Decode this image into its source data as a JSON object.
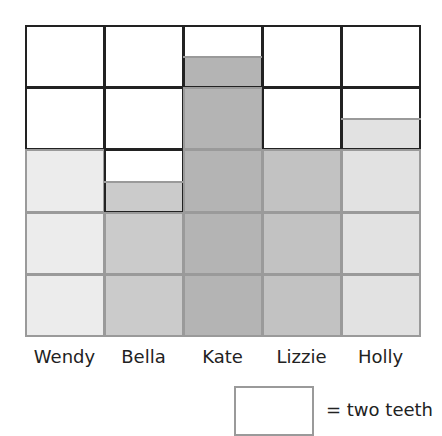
{
  "chart_data": {
    "type": "bar",
    "title": "",
    "xlabel": "",
    "ylabel": "",
    "categories": [
      "Wendy",
      "Bella",
      "Kate",
      "Lizzie",
      "Holly"
    ],
    "values": [
      6,
      5,
      9,
      6,
      7
    ],
    "units_per_square": 2,
    "ylim": [
      0,
      10
    ],
    "grid": true,
    "colors": [
      "#ececec",
      "#cbcbcb",
      "#b4b4b4",
      "#c2c2c2",
      "#e2e2e2"
    ],
    "legend": {
      "symbol": "empty-square",
      "text": "= two teeth"
    }
  },
  "labels": [
    "Wendy",
    "Bella",
    "Kate",
    "Lizzie",
    "Holly"
  ],
  "legend_text": "= two teeth"
}
